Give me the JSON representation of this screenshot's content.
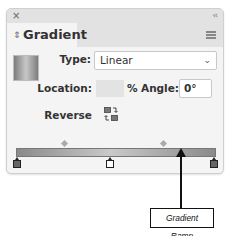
{
  "panel": {
    "title": "Gradient",
    "close_icon": "×",
    "collapse_icon": "‹‹",
    "tab_arrows_icon": "⇕",
    "menu_icon": "hamburger-menu"
  },
  "fields": {
    "type_label": "Type:",
    "type_value": "Linear",
    "type_chevron": "⌄",
    "location_label": "Location:",
    "location_value": "",
    "percent_label": "%",
    "angle_label": "Angle:",
    "angle_value": "0°",
    "reverse_label": "Reverse"
  },
  "ramp": {
    "stops": [
      {
        "position": 0,
        "color": "#8a8a8a",
        "selected": false
      },
      {
        "position": 47,
        "color": "#ffffff",
        "selected": true
      },
      {
        "position": 100,
        "color": "#8a8a8a",
        "selected": false
      }
    ],
    "midpoints": [
      25,
      75
    ]
  },
  "callout": {
    "label": "Gradient Ramp"
  },
  "colors": {
    "panel_bg": "#f4f4f4",
    "header_bg": "#e2e2e2",
    "text": "#333333"
  }
}
